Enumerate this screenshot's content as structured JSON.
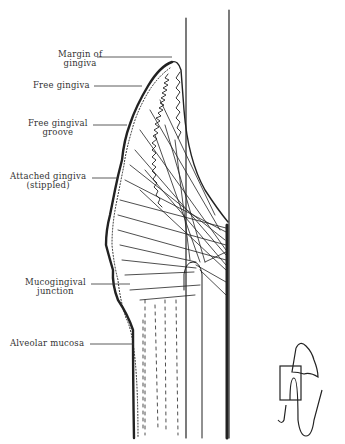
{
  "figure": {
    "labels": [
      {
        "id": "margin",
        "lines": [
          "Margin of",
          "gingiva"
        ]
      },
      {
        "id": "free",
        "lines": [
          "Free gingiva"
        ]
      },
      {
        "id": "groove",
        "lines": [
          "Free gingival",
          "groove"
        ]
      },
      {
        "id": "attached",
        "lines": [
          "Attached gingiva",
          "(stippled)"
        ]
      },
      {
        "id": "mucogingival",
        "lines": [
          "Mucogingival",
          "junction"
        ]
      },
      {
        "id": "alveolar",
        "lines": [
          "Alveolar mucosa"
        ]
      }
    ],
    "inset": "tooth-orientation-thumbnail"
  }
}
